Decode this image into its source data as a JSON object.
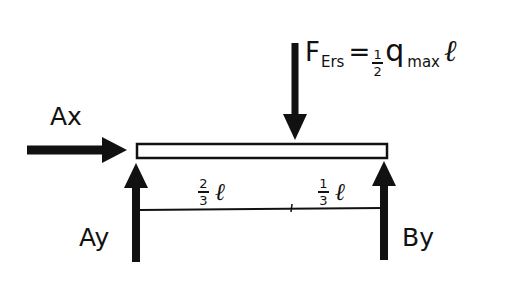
{
  "diagram": {
    "type": "free-body diagram",
    "beam": {
      "label": "beam"
    },
    "forces": {
      "resultant": {
        "symbol": "F",
        "subscript": "Ers",
        "equals": "=",
        "coef_num": "1",
        "coef_den": "2",
        "q": "q",
        "q_sub": "max",
        "length": "ℓ",
        "direction": "down"
      },
      "ax": {
        "label": "Ax",
        "direction": "right"
      },
      "ay": {
        "label": "Ay",
        "direction": "up"
      },
      "by": {
        "label": "By",
        "direction": "up"
      }
    },
    "dimensions": {
      "left": {
        "num": "2",
        "den": "3",
        "length": "ℓ"
      },
      "right": {
        "num": "1",
        "den": "3",
        "length": "ℓ"
      }
    },
    "colors": {
      "ink": "#111111",
      "background": "#ffffff"
    }
  }
}
